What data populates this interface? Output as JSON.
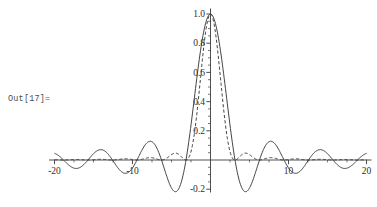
{
  "output_label": {
    "text": "Out[17]="
  },
  "chart_data": {
    "type": "line",
    "title": "",
    "xlabel": "",
    "ylabel": "",
    "xlim": [
      -20,
      20
    ],
    "ylim": [
      -0.2,
      1.0
    ],
    "grid": false,
    "legend": null,
    "axis_color": "#3c3c3c",
    "x_major_ticks": [
      -20,
      -10,
      10,
      20
    ],
    "x_tick_labels": [
      "-20",
      "-10",
      "10",
      "20"
    ],
    "x_minor_step": 2.5,
    "y_major_ticks": [
      -0.2,
      0.2,
      0.4,
      0.6,
      0.8,
      1.0
    ],
    "y_tick_labels": [
      "-0.2",
      "0.2",
      "0.4",
      "0.6",
      "0.8",
      "1.0"
    ],
    "y_minor_step": 0.05,
    "series": [
      {
        "name": "sinc",
        "expression": "sin(x)/x",
        "style": "solid",
        "color": "#3a3a3a",
        "key_points": [
          [
            -20,
            0.046
          ],
          [
            -18.85,
            0
          ],
          [
            -17.22,
            -0.058
          ],
          [
            -15.71,
            0
          ],
          [
            -14.07,
            0.071
          ],
          [
            -12.57,
            0
          ],
          [
            -10.9,
            -0.091
          ],
          [
            -9.42,
            0
          ],
          [
            -7.73,
            0.128
          ],
          [
            -6.28,
            0
          ],
          [
            -4.49,
            -0.217
          ],
          [
            -3.14,
            0
          ],
          [
            0,
            1.0
          ],
          [
            3.14,
            0
          ],
          [
            4.49,
            -0.217
          ],
          [
            6.28,
            0
          ],
          [
            7.73,
            0.128
          ],
          [
            9.42,
            0
          ],
          [
            10.9,
            -0.091
          ],
          [
            12.57,
            0
          ],
          [
            14.07,
            0.071
          ],
          [
            15.71,
            0
          ],
          [
            17.22,
            -0.058
          ],
          [
            18.85,
            0
          ],
          [
            20,
            0.046
          ]
        ]
      },
      {
        "name": "sinc-squared",
        "expression": "(sin(x)/x)^2",
        "style": "dashed",
        "color": "#3a3a3a",
        "key_points": [
          [
            -20,
            0.002
          ],
          [
            -17.22,
            0.003
          ],
          [
            -15.71,
            0
          ],
          [
            -14.07,
            0.005
          ],
          [
            -12.57,
            0
          ],
          [
            -10.9,
            0.008
          ],
          [
            -9.42,
            0
          ],
          [
            -7.73,
            0.017
          ],
          [
            -6.28,
            0
          ],
          [
            -4.49,
            0.047
          ],
          [
            -3.14,
            0
          ],
          [
            0,
            1.0
          ],
          [
            3.14,
            0
          ],
          [
            4.49,
            0.047
          ],
          [
            6.28,
            0
          ],
          [
            7.73,
            0.017
          ],
          [
            9.42,
            0
          ],
          [
            10.9,
            0.008
          ],
          [
            12.57,
            0
          ],
          [
            14.07,
            0.005
          ],
          [
            15.71,
            0
          ],
          [
            17.22,
            0.003
          ],
          [
            18.85,
            0
          ],
          [
            20,
            0.002
          ]
        ]
      }
    ]
  }
}
